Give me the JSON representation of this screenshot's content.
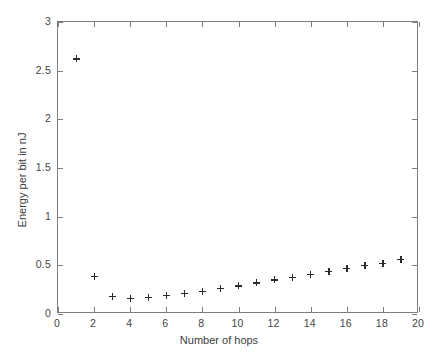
{
  "chart_data": {
    "type": "scatter",
    "title": "",
    "xlabel": "Number of hops",
    "ylabel": "Energy per bit in nJ",
    "xlim": [
      0,
      20
    ],
    "ylim": [
      0,
      3
    ],
    "xticks": [
      0,
      2,
      4,
      6,
      8,
      10,
      12,
      14,
      16,
      18,
      20
    ],
    "xticklabels": [
      "0",
      "2",
      "4",
      "6",
      "8",
      "10",
      "12",
      "14",
      "16",
      "18",
      "20"
    ],
    "yticks": [
      0,
      0.5,
      1,
      1.5,
      2,
      2.5,
      3
    ],
    "yticklabels": [
      "0",
      "0.5",
      "1",
      "1.5",
      "2",
      "2.5",
      "3"
    ],
    "grid": false,
    "legend": null,
    "marker": "+",
    "marker_color": "#2b2b2b",
    "frame_color": "#7d7d7d",
    "background": "#ffffff",
    "x": [
      1,
      2,
      3,
      4,
      5,
      6,
      7,
      8,
      9,
      10,
      11,
      12,
      13,
      14,
      15,
      16,
      17,
      18,
      19
    ],
    "values": [
      2.62,
      0.39,
      0.18,
      0.16,
      0.17,
      0.19,
      0.21,
      0.23,
      0.26,
      0.29,
      0.32,
      0.35,
      0.38,
      0.41,
      0.44,
      0.47,
      0.5,
      0.52,
      0.56
    ],
    "series": [
      {
        "name": "Energy per bit",
        "x": [
          1,
          2,
          3,
          4,
          5,
          6,
          7,
          8,
          9,
          10,
          11,
          12,
          13,
          14,
          15,
          16,
          17,
          18,
          19
        ],
        "values": [
          2.62,
          0.39,
          0.18,
          0.16,
          0.17,
          0.19,
          0.21,
          0.23,
          0.26,
          0.29,
          0.32,
          0.35,
          0.38,
          0.41,
          0.44,
          0.47,
          0.5,
          0.52,
          0.56
        ]
      }
    ]
  }
}
